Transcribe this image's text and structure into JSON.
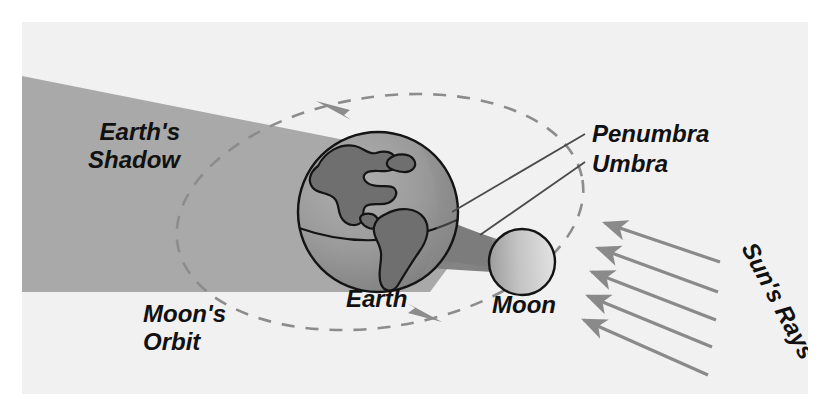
{
  "figure": {
    "panel_background": "#f1f1f1",
    "page_background": "#ffffff"
  },
  "colors": {
    "penumbra": "#a9a9a9",
    "umbra": "#7e7e7e",
    "earth_light": "#9a9a9a",
    "earth_land": "#6f6f6f",
    "outline": "#141414",
    "orbit_line": "#8c8c8c",
    "ray_arrow": "#8a8a8a",
    "leader_line": "#4a4a4a",
    "moon_light": "#d8d8d8",
    "moon_dark": "#9e9e9e",
    "text": "#111111"
  },
  "labels": {
    "earths_shadow_line1": "Earth's",
    "earths_shadow_line2": "Shadow",
    "penumbra": "Penumbra",
    "umbra": "Umbra",
    "earth": "Earth",
    "moon": "Moon",
    "moons_orbit_line1": "Moon's",
    "moons_orbit_line2": "Orbit",
    "suns_rays": "Sun's Rays"
  },
  "diagram_data": {
    "type": "astronomy-diagram",
    "subject": "lunar eclipse geometry",
    "bodies": [
      {
        "name": "Earth",
        "shape": "sphere",
        "cx": 378,
        "cy": 212,
        "r": 80,
        "shaded": true
      },
      {
        "name": "Moon",
        "shape": "circle",
        "cx": 522,
        "cy": 262,
        "r": 33,
        "shaded": true
      }
    ],
    "shadow_regions": [
      {
        "name": "Penumbra",
        "tone": "light-gray",
        "direction": "to upper-left from Earth"
      },
      {
        "name": "Umbra",
        "tone": "dark-gray",
        "direction": "cone to left from Earth"
      }
    ],
    "orbit": {
      "name": "Moon's Orbit",
      "shape": "dashed ellipse",
      "cx": 380,
      "cy": 212,
      "rx": 205,
      "ry": 115,
      "rotation_deg": -9,
      "direction_arrows": 2
    },
    "sun_rays": {
      "name": "Sun's Rays",
      "count": 5,
      "direction": "right to left, pointing up-left toward Earth and Moon"
    },
    "leader_lines": [
      {
        "label": "Penumbra",
        "points_to": "penumbra shadow boundary"
      },
      {
        "label": "Umbra",
        "points_to": "umbra shadow cone"
      }
    ]
  }
}
